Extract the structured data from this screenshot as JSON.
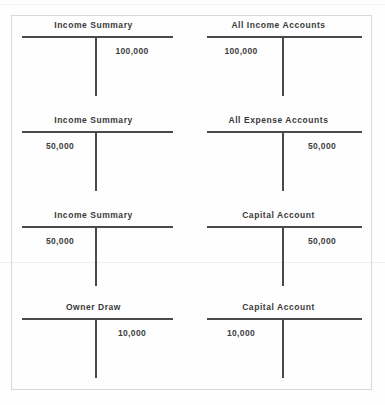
{
  "document": {
    "type": "accounting-worksheet",
    "description": "Closing entries shown as T-accounts",
    "border_color": "#d9d9d9",
    "ink_color": "#4a4a4a",
    "text_color": "#3a3a3a"
  },
  "t_accounts": [
    {
      "id": "income-summary-1",
      "title": "Income Summary",
      "column": "left",
      "row": 1,
      "debit": "",
      "credit": "100,000"
    },
    {
      "id": "all-income-accounts",
      "title": "All Income Accounts",
      "column": "right",
      "row": 1,
      "debit": "100,000",
      "credit": ""
    },
    {
      "id": "income-summary-2",
      "title": "Income Summary",
      "column": "left",
      "row": 2,
      "debit": "50,000",
      "credit": ""
    },
    {
      "id": "all-expense-accounts",
      "title": "All Expense Accounts",
      "column": "right",
      "row": 2,
      "debit": "",
      "credit": "50,000"
    },
    {
      "id": "income-summary-3",
      "title": "Income Summary",
      "column": "left",
      "row": 3,
      "debit": "50,000",
      "credit": ""
    },
    {
      "id": "capital-account-1",
      "title": "Capital Account",
      "column": "right",
      "row": 3,
      "debit": "",
      "credit": "50,000"
    },
    {
      "id": "owner-draw",
      "title": "Owner Draw",
      "column": "left",
      "row": 4,
      "debit": "",
      "credit": "10,000"
    },
    {
      "id": "capital-account-2",
      "title": "Capital Account",
      "column": "right",
      "row": 4,
      "debit": "10,000",
      "credit": ""
    }
  ]
}
